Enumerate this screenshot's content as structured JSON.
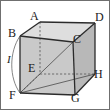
{
  "figure": {
    "kind": "geometry-diagram",
    "shape_name": "cube",
    "canvas": {
      "width": 110,
      "height": 110
    },
    "colors": {
      "stroke": "#2b2b2b",
      "hidden_stroke": "#555555",
      "face_front": "#c9c9c9",
      "face_right": "#b8b8b8",
      "face_top": "#dedede",
      "background": "#ffffff",
      "border": "#6f6f6f",
      "label_color": "#1a1a1a"
    },
    "border": {
      "visible": true,
      "width_px": 1
    },
    "vertices": [
      {
        "id": "A",
        "label": "A",
        "role": "back-top-left",
        "point": {
          "x": 40,
          "y": 22
        },
        "label_pos": {
          "x": 30,
          "y": 10
        }
      },
      {
        "id": "B",
        "label": "B",
        "role": "front-top-left",
        "point": {
          "x": 20,
          "y": 36
        },
        "label_pos": {
          "x": 8,
          "y": 27
        }
      },
      {
        "id": "C",
        "label": "C",
        "role": "front-top-right",
        "point": {
          "x": 73,
          "y": 42
        },
        "label_pos": {
          "x": 73,
          "y": 33
        }
      },
      {
        "id": "D",
        "label": "D",
        "role": "back-top-right",
        "point": {
          "x": 95,
          "y": 23
        },
        "label_pos": {
          "x": 95,
          "y": 11
        }
      },
      {
        "id": "E",
        "label": "E",
        "role": "back-bottom-left",
        "point": {
          "x": 40,
          "y": 74
        },
        "label_pos": {
          "x": 28,
          "y": 62
        }
      },
      {
        "id": "F",
        "label": "F",
        "role": "front-bottom-left",
        "point": {
          "x": 20,
          "y": 93
        },
        "label_pos": {
          "x": 9,
          "y": 89
        }
      },
      {
        "id": "G",
        "label": "G",
        "role": "front-bottom-right",
        "point": {
          "x": 75,
          "y": 95
        },
        "label_pos": {
          "x": 71,
          "y": 92
        }
      },
      {
        "id": "H",
        "label": "H",
        "role": "back-bottom-right",
        "point": {
          "x": 95,
          "y": 74
        },
        "label_pos": {
          "x": 94,
          "y": 68
        }
      }
    ],
    "solid_edges": [
      {
        "name": "edge-B-A",
        "from": "B",
        "to": "A"
      },
      {
        "name": "edge-A-D",
        "from": "A",
        "to": "D"
      },
      {
        "name": "edge-D-C",
        "from": "D",
        "to": "C"
      },
      {
        "name": "edge-C-B",
        "from": "C",
        "to": "B"
      },
      {
        "name": "edge-B-F",
        "from": "B",
        "to": "F"
      },
      {
        "name": "edge-C-G",
        "from": "C",
        "to": "G"
      },
      {
        "name": "edge-D-H",
        "from": "D",
        "to": "H"
      },
      {
        "name": "edge-F-G",
        "from": "F",
        "to": "G"
      },
      {
        "name": "edge-G-H",
        "from": "G",
        "to": "H"
      }
    ],
    "hidden_edges": [
      {
        "name": "edge-A-E",
        "from": "A",
        "to": "E"
      },
      {
        "name": "edge-E-F",
        "from": "E",
        "to": "F"
      },
      {
        "name": "edge-E-H",
        "from": "E",
        "to": "H"
      }
    ],
    "diagonals": [
      {
        "name": "diagonal-F-C",
        "from": "F",
        "to": "C"
      },
      {
        "name": "diagonal-F-E",
        "from": "F",
        "to": "E"
      },
      {
        "name": "diagonal-F-H",
        "from": "F",
        "to": "H"
      }
    ],
    "faces": [
      {
        "name": "face-front",
        "vertices": "B,C,G,F",
        "fill": "#c9c9c9"
      },
      {
        "name": "face-right",
        "vertices": "C,D,H,G",
        "fill": "#b8b8b8"
      },
      {
        "name": "face-top",
        "vertices": "B,A,D,C",
        "fill": "#dedede"
      }
    ],
    "arc": {
      "name": "arc-B-F",
      "from": "B",
      "to": "F",
      "bulge": "left",
      "label": "I",
      "label_pos": {
        "x": 7,
        "y": 53
      },
      "stroke": "#555555"
    }
  }
}
